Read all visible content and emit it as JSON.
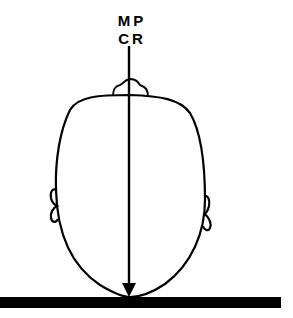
{
  "diagram": {
    "labels": {
      "line1": "MP",
      "line2": "CR"
    },
    "parts": [
      "head-outline",
      "nose",
      "left-ear",
      "right-ear",
      "central-ray-arrow",
      "image-receptor-bar"
    ],
    "colors": {
      "stroke": "#000000",
      "background": "#ffffff"
    }
  }
}
